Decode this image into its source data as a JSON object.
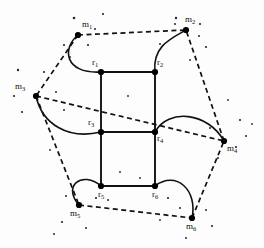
{
  "figure": {
    "name": "graph-diagram",
    "background": "#fdfdfd",
    "width": 264,
    "height": 248,
    "solid_color": "#111111",
    "dashed_color": "#111111",
    "node_color": "#000000"
  },
  "inner_nodes": [
    {
      "id": "r1",
      "label": "r",
      "sub": "1",
      "x": 101,
      "y": 72,
      "label_x": 92,
      "label_y": 58
    },
    {
      "id": "r2",
      "label": "r",
      "sub": "2",
      "x": 155,
      "y": 72,
      "label_x": 157,
      "label_y": 58
    },
    {
      "id": "r3",
      "label": "r",
      "sub": "3",
      "x": 101,
      "y": 132,
      "label_x": 88,
      "label_y": 118
    },
    {
      "id": "r4",
      "label": "r",
      "sub": "4",
      "x": 155,
      "y": 132,
      "label_x": 157,
      "label_y": 134
    },
    {
      "id": "r5",
      "label": "r",
      "sub": "5",
      "x": 101,
      "y": 186,
      "label_x": 98,
      "label_y": 190
    },
    {
      "id": "r6",
      "label": "r",
      "sub": "6",
      "x": 155,
      "y": 186,
      "label_x": 152,
      "label_y": 190
    }
  ],
  "outer_nodes": [
    {
      "id": "m1",
      "label": "m",
      "sub": "1",
      "x": 78,
      "y": 35,
      "label_x": 82,
      "label_y": 20
    },
    {
      "id": "m2",
      "label": "m",
      "sub": "2",
      "x": 186,
      "y": 30,
      "label_x": 185,
      "label_y": 15
    },
    {
      "id": "m3",
      "label": "m",
      "sub": "3",
      "x": 36,
      "y": 96,
      "label_x": 15,
      "label_y": 82
    },
    {
      "id": "m4",
      "label": "m",
      "sub": "4",
      "x": 224,
      "y": 141,
      "label_x": 227,
      "label_y": 144
    },
    {
      "id": "m5",
      "label": "m",
      "sub": "5",
      "x": 79,
      "y": 205,
      "label_x": 70,
      "label_y": 209
    },
    {
      "id": "m6",
      "label": "m",
      "sub": "6",
      "x": 192,
      "y": 218,
      "label_x": 186,
      "label_y": 222
    }
  ],
  "grid_edges": [
    {
      "from": "r1",
      "to": "r2",
      "type": "solid"
    },
    {
      "from": "r3",
      "to": "r4",
      "type": "solid"
    },
    {
      "from": "r5",
      "to": "r6",
      "type": "solid"
    },
    {
      "from": "r1",
      "to": "r3",
      "type": "solid"
    },
    {
      "from": "r3",
      "to": "r5",
      "type": "solid"
    },
    {
      "from": "r2",
      "to": "r4",
      "type": "solid"
    },
    {
      "from": "r4",
      "to": "r6",
      "type": "solid"
    }
  ],
  "arc_edges": [
    {
      "from": "m1",
      "to": "r1",
      "type": "solid-arc",
      "path": "M78,35 C62,48 64,74 101,72"
    },
    {
      "from": "m2",
      "to": "r2",
      "type": "solid-arc",
      "path": "M186,30 C172,38 152,46 155,72"
    },
    {
      "from": "m3",
      "to": "r3",
      "type": "solid-arc",
      "path": "M36,96 C42,124 68,140 101,132"
    },
    {
      "from": "r4",
      "to": "m4",
      "type": "solid-arc",
      "path": "M155,132 C168,108 208,112 224,141"
    },
    {
      "from": "r5",
      "to": "m5",
      "type": "solid-arc",
      "path": "M101,186 C82,170 62,186 79,205"
    },
    {
      "from": "r6",
      "to": "m6",
      "type": "solid-arc",
      "path": "M155,186 C176,170 198,190 192,218"
    }
  ],
  "dashed_edges": [
    {
      "from": "m1",
      "to": "m2",
      "type": "dashed"
    },
    {
      "from": "m1",
      "to": "m3",
      "type": "dashed"
    },
    {
      "from": "m3",
      "to": "m5",
      "type": "dashed"
    },
    {
      "from": "m5",
      "to": "m6",
      "type": "dashed"
    },
    {
      "from": "m6",
      "to": "m4",
      "type": "dashed"
    },
    {
      "from": "m4",
      "to": "m2",
      "type": "dashed"
    },
    {
      "from": "m3",
      "to": "m4",
      "type": "dashed"
    }
  ],
  "speckles": [
    {
      "x": 74,
      "y": 18,
      "r": 1.3
    },
    {
      "x": 103,
      "y": 14,
      "r": 1.1
    },
    {
      "x": 95,
      "y": 29,
      "r": 1.0
    },
    {
      "x": 64,
      "y": 45,
      "r": 1.1
    },
    {
      "x": 88,
      "y": 45,
      "r": 1.1
    },
    {
      "x": 176,
      "y": 18,
      "r": 1.2
    },
    {
      "x": 175,
      "y": 24,
      "r": 1.0
    },
    {
      "x": 200,
      "y": 24,
      "r": 1.1
    },
    {
      "x": 199,
      "y": 36,
      "r": 1.0
    },
    {
      "x": 206,
      "y": 47,
      "r": 1.1
    },
    {
      "x": 160,
      "y": 44,
      "r": 1.0
    },
    {
      "x": 18,
      "y": 70,
      "r": 1.2
    },
    {
      "x": 44,
      "y": 72,
      "r": 1.1
    },
    {
      "x": 14,
      "y": 96,
      "r": 1.1
    },
    {
      "x": 56,
      "y": 92,
      "r": 1.0
    },
    {
      "x": 22,
      "y": 112,
      "r": 1.1
    },
    {
      "x": 64,
      "y": 110,
      "r": 1.0
    },
    {
      "x": 70,
      "y": 57,
      "r": 0.9
    },
    {
      "x": 240,
      "y": 120,
      "r": 1.1
    },
    {
      "x": 246,
      "y": 136,
      "r": 1.0
    },
    {
      "x": 236,
      "y": 147,
      "r": 1.1
    },
    {
      "x": 210,
      "y": 128,
      "r": 1.0
    },
    {
      "x": 218,
      "y": 158,
      "r": 1.0
    },
    {
      "x": 252,
      "y": 124,
      "r": 0.9
    },
    {
      "x": 66,
      "y": 196,
      "r": 1.0
    },
    {
      "x": 96,
      "y": 198,
      "r": 1.1
    },
    {
      "x": 108,
      "y": 200,
      "r": 1.0
    },
    {
      "x": 62,
      "y": 222,
      "r": 1.1
    },
    {
      "x": 86,
      "y": 228,
      "r": 1.0
    },
    {
      "x": 54,
      "y": 234,
      "r": 1.0
    },
    {
      "x": 168,
      "y": 198,
      "r": 1.1
    },
    {
      "x": 180,
      "y": 208,
      "r": 1.0
    },
    {
      "x": 206,
      "y": 210,
      "r": 1.0
    },
    {
      "x": 212,
      "y": 226,
      "r": 1.1
    },
    {
      "x": 186,
      "y": 238,
      "r": 1.0
    },
    {
      "x": 160,
      "y": 220,
      "r": 0.9
    },
    {
      "x": 120,
      "y": 172,
      "r": 0.9
    },
    {
      "x": 140,
      "y": 178,
      "r": 0.9
    },
    {
      "x": 128,
      "y": 96,
      "r": 0.9
    },
    {
      "x": 190,
      "y": 60,
      "r": 0.9
    },
    {
      "x": 50,
      "y": 150,
      "r": 0.9
    },
    {
      "x": 228,
      "y": 100,
      "r": 0.9
    }
  ]
}
